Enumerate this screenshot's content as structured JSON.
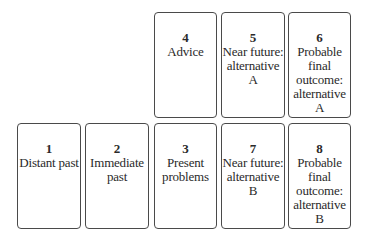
{
  "cards": [
    {
      "number": "1",
      "label": "Distant past"
    },
    {
      "number": "2",
      "label": "Immediate\npast"
    },
    {
      "number": "3",
      "label": "Present\nproblems"
    },
    {
      "number": "4",
      "label": "Advice"
    },
    {
      "number": "5",
      "label": "Near future:\nalternative A"
    },
    {
      "number": "6",
      "label": "Probable\nfinal\noutcome:\nalternative A"
    },
    {
      "number": "7",
      "label": "Near future:\nalternative B"
    },
    {
      "number": "8",
      "label": "Probable\nfinal\noutcome:\nalternative B"
    }
  ]
}
